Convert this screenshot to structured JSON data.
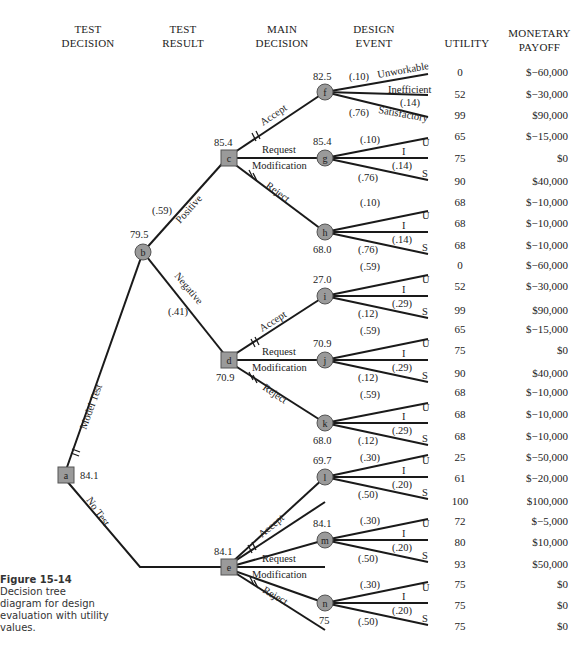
{
  "headers": {
    "test_decision": [
      "TEST",
      "DECISION"
    ],
    "test_result": [
      "TEST",
      "RESULT"
    ],
    "main_decision": [
      "MAIN",
      "DECISION"
    ],
    "design_event": [
      "DESIGN",
      "EVENT"
    ],
    "utility": "UTILITY",
    "monetary_payoff": [
      "MONETARY",
      "PAYOFF"
    ]
  },
  "caption": {
    "label": "Figure 15-14",
    "text": "Decision tree diagram for design evaluation with utility values."
  },
  "nodes": {
    "a": {
      "type": "decision",
      "value": "84.1"
    },
    "b": {
      "type": "chance",
      "value": "79.5"
    },
    "c": {
      "type": "decision",
      "value": "85.4"
    },
    "d": {
      "type": "decision",
      "value": "70.9"
    },
    "e": {
      "type": "decision",
      "value": "84.1"
    },
    "f": {
      "type": "chance",
      "value": "82.5"
    },
    "g": {
      "type": "chance",
      "value": "85.4"
    },
    "h": {
      "type": "chance",
      "value": "68.0"
    },
    "i": {
      "type": "chance",
      "value": "27.0"
    },
    "j": {
      "type": "chance",
      "value": "70.9"
    },
    "k": {
      "type": "chance",
      "value": "68.0"
    },
    "l": {
      "type": "chance",
      "value": "69.7"
    },
    "m": {
      "type": "chance",
      "value": "84.1"
    },
    "n": {
      "type": "chance",
      "value": "75"
    }
  },
  "branch_labels": {
    "model_test": "Model Test",
    "no_test": "No Test",
    "positive": "Positive",
    "positive_prob": "(.59)",
    "negative": "Negative",
    "negative_prob": "(.41)",
    "accept": "Accept",
    "request": "Request",
    "modification": "Modification",
    "reject": "Reject",
    "unworkable": "Unworkable",
    "inefficient": "Inefficient",
    "satisfactory": "Satisfactory",
    "u": "U",
    "i": "I",
    "s": "S"
  },
  "event_probs": {
    "f": [
      "(.10)",
      "(.14)",
      "(.76)"
    ],
    "g": [
      "(.10)",
      "(.14)",
      "(.76)"
    ],
    "h": [
      "(.10)",
      "(.14)",
      "(.76)"
    ],
    "i": [
      "(.59)",
      "(.29)",
      "(.12)"
    ],
    "j": [
      "(.59)",
      "(.29)",
      "(.12)"
    ],
    "k": [
      "(.59)",
      "(.29)",
      "(.12)"
    ],
    "l": [
      "(.30)",
      "(.20)",
      "(.50)"
    ],
    "m": [
      "(.30)",
      "(.20)",
      "(.50)"
    ],
    "n": [
      "(.30)",
      "(.20)",
      "(.50)"
    ]
  },
  "outcomes": [
    {
      "utility": "0",
      "payoff": "$−60,000"
    },
    {
      "utility": "52",
      "payoff": "$−30,000"
    },
    {
      "utility": "99",
      "payoff": "$90,000"
    },
    {
      "utility": "65",
      "payoff": "$−15,000"
    },
    {
      "utility": "75",
      "payoff": "$0"
    },
    {
      "utility": "90",
      "payoff": "$40,000"
    },
    {
      "utility": "68",
      "payoff": "$−10,000"
    },
    {
      "utility": "68",
      "payoff": "$−10,000"
    },
    {
      "utility": "68",
      "payoff": "$−10,000"
    },
    {
      "utility": "0",
      "payoff": "$−60,000"
    },
    {
      "utility": "52",
      "payoff": "$−30,000"
    },
    {
      "utility": "99",
      "payoff": "$90,000"
    },
    {
      "utility": "65",
      "payoff": "$−15,000"
    },
    {
      "utility": "75",
      "payoff": "$0"
    },
    {
      "utility": "90",
      "payoff": "$40,000"
    },
    {
      "utility": "68",
      "payoff": "$−10,000"
    },
    {
      "utility": "68",
      "payoff": "$−10,000"
    },
    {
      "utility": "68",
      "payoff": "$−10,000"
    },
    {
      "utility": "25",
      "payoff": "$−50,000"
    },
    {
      "utility": "61",
      "payoff": "$−20,000"
    },
    {
      "utility": "100",
      "payoff": "$100,000"
    },
    {
      "utility": "72",
      "payoff": "$−5,000"
    },
    {
      "utility": "80",
      "payoff": "$10,000"
    },
    {
      "utility": "93",
      "payoff": "$50,000"
    },
    {
      "utility": "75",
      "payoff": "$0"
    },
    {
      "utility": "75",
      "payoff": "$0"
    },
    {
      "utility": "75",
      "payoff": "$0"
    }
  ],
  "colors": {
    "line": "#1a1a1a",
    "node_fill": "#9a9a9a",
    "node_stroke": "#555555",
    "background": "#ffffff"
  }
}
